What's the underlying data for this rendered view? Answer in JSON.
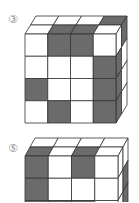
{
  "colors": {
    "dark": "#6b6b6b",
    "light": "#ffffff",
    "line": "#333333"
  },
  "figures": [
    {
      "label": "③",
      "origin": {
        "x": 25,
        "y": 34
      },
      "cell": {
        "w": 22.75,
        "h": 22.25
      },
      "depth": {
        "dx": 5.5,
        "dy": -9
      },
      "front": [
        [
          "W",
          "D",
          "D",
          "W"
        ],
        [
          "W",
          "W",
          "W",
          "D"
        ],
        [
          "D",
          "W",
          "W",
          "D"
        ],
        [
          "W",
          "D",
          "W",
          "D"
        ]
      ],
      "top_back_to_front": [
        [
          "W",
          "W",
          "W",
          "D"
        ],
        [
          "W",
          "D",
          "D",
          "W"
        ]
      ],
      "right_front_to_back_by_row": [
        [
          "W",
          "D"
        ],
        [
          "D",
          "W"
        ],
        [
          "D",
          "W"
        ],
        [
          "D",
          "W"
        ]
      ]
    },
    {
      "label": "⑤",
      "origin": {
        "x": 25,
        "y": 156
      },
      "cell": {
        "w": 23.25,
        "h": 22.25
      },
      "depth": {
        "dx": 5,
        "dy": -9
      },
      "front": [
        [
          "D",
          "W",
          "D",
          "W"
        ],
        [
          "D",
          "W",
          "W",
          "W"
        ],
        [
          "D",
          "D",
          "D",
          "W"
        ],
        [
          "W",
          "W",
          "W",
          "W"
        ]
      ],
      "top_back_to_front": [
        [
          "W",
          "W",
          "W",
          "W"
        ],
        [
          "D",
          "W",
          "D",
          "W"
        ]
      ],
      "right_front_to_back_by_row": [
        [
          "W",
          "W"
        ],
        [
          "W",
          "D"
        ],
        [
          "W",
          "D"
        ],
        [
          "W",
          "W"
        ]
      ]
    }
  ]
}
